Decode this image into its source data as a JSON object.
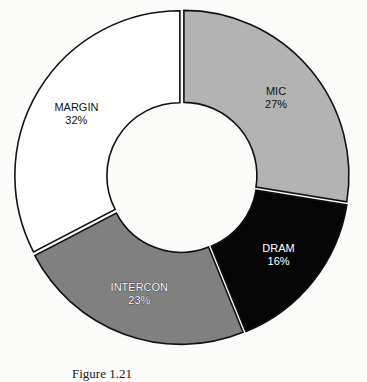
{
  "chart_data": {
    "type": "pie",
    "style": "donut",
    "title": "",
    "start_angle_deg": 0,
    "direction": "clockwise",
    "categories": [
      "MIC",
      "DRAM",
      "INTERCON",
      "MARGIN"
    ],
    "values": [
      27,
      16,
      23,
      32
    ],
    "labels": [
      "27%",
      "16%",
      "23%",
      "32%"
    ],
    "colors": [
      "#b3b3b3",
      "#050505",
      "#808080",
      "#ffffff"
    ],
    "label_colors": [
      "#111111",
      "#ffffff",
      "#ffffff",
      "#111111"
    ],
    "legend": "none"
  },
  "slices": [
    {
      "name": "MIC",
      "pct": "27%"
    },
    {
      "name": "DRAM",
      "pct": "16%"
    },
    {
      "name": "INTERCON",
      "pct": "23%"
    },
    {
      "name": "MARGIN",
      "pct": "32%"
    }
  ],
  "caption": "Figure 1.21"
}
